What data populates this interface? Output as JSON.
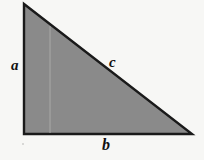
{
  "figure": {
    "kind": "right-triangle-diagram",
    "background_color": "#f7f7f5",
    "fill_color": "#8a8a8a",
    "stroke_color": "#1a1a1a",
    "stroke_width": 2.4,
    "inner_guide_color": "#a9a9a7",
    "vertices": {
      "apex": [
        24,
        4
      ],
      "bottom_left": [
        24,
        134
      ],
      "bottom_right": [
        192,
        134
      ]
    },
    "inner_guide_x": 50,
    "labels": {
      "leg_vertical": "a",
      "hypotenuse": "c",
      "leg_horizontal": "b"
    }
  }
}
